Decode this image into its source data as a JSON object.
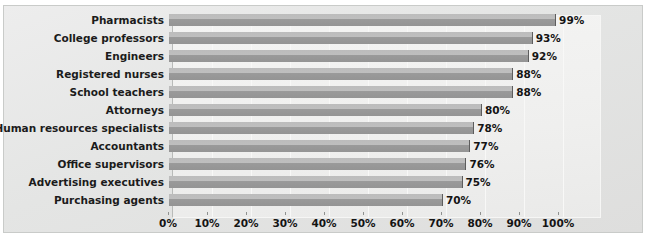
{
  "chart_data": {
    "type": "bar",
    "orientation": "horizontal",
    "title": "",
    "subtitle": "",
    "xlabel": "",
    "ylabel": "",
    "xlim": [
      0,
      100
    ],
    "xticks": [
      "0%",
      "10%",
      "20%",
      "30%",
      "40%",
      "50%",
      "60%",
      "70%",
      "80%",
      "90%",
      "100%"
    ],
    "xtick_values": [
      0,
      10,
      20,
      30,
      40,
      50,
      60,
      70,
      80,
      90,
      100
    ],
    "grid": true,
    "legend": null,
    "categories": [
      "Pharmacists",
      "College professors",
      "Engineers",
      "Registered nurses",
      "School teachers",
      "Attorneys",
      "Human resources specialists",
      "Accountants",
      "Office supervisors",
      "Advertising executives",
      "Purchasing agents"
    ],
    "values": [
      99,
      93,
      92,
      88,
      88,
      80,
      78,
      77,
      76,
      75,
      70
    ],
    "data_labels": [
      "99%",
      "93%",
      "92%",
      "88%",
      "88%",
      "80%",
      "78%",
      "77%",
      "76%",
      "75%",
      "70%"
    ],
    "colors": {
      "bar_top": "#bfbfbf",
      "bar_bottom": "#949494",
      "bar_edge": "#5d5d5d",
      "plot_background": "#f1f1f0",
      "chart_background": "#e7e8e7",
      "axis_line": "#b9bbb9",
      "text": "#141414"
    }
  }
}
